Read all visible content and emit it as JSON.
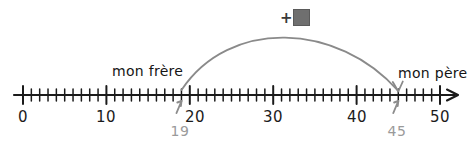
{
  "figure": {
    "type": "number-line-diagram",
    "language": "fr",
    "colors": {
      "line": "#1b1b1b",
      "axis_label": "#1b1b1b",
      "annotation_gray": "#9a9a9a",
      "arc": "#8a8a8a",
      "answer_box_fill": "#6f6f6f",
      "background": "#ffffff"
    }
  },
  "number_line": {
    "min": 0,
    "max": 50,
    "minor_tick_step": 1,
    "major_tick_step": 10,
    "has_end_arrow": true,
    "major_labels": [
      {
        "value": 0,
        "text": "0"
      },
      {
        "value": 10,
        "text": "10"
      },
      {
        "value": 20,
        "text": "20"
      },
      {
        "value": 30,
        "text": "30"
      },
      {
        "value": 40,
        "text": "40"
      },
      {
        "value": 50,
        "text": "50"
      }
    ]
  },
  "markers": [
    {
      "id": "mon-frere",
      "label": "mon frère",
      "value": 19,
      "value_text": "19",
      "arrow": "up"
    },
    {
      "id": "mon-pere",
      "label": "mon père",
      "value": 45,
      "value_text": "45",
      "arrow": "up"
    }
  ],
  "jump_arc": {
    "from": 19,
    "to": 45,
    "direction": "right",
    "operator": "+",
    "operand_text": "",
    "operand_hidden": true
  },
  "chart_data": {
    "type": "number-line",
    "title": "",
    "xlabel": "",
    "ylabel": "",
    "xlim": [
      0,
      50
    ],
    "tick_labels": [
      "0",
      "10",
      "20",
      "30",
      "40",
      "50"
    ],
    "minor_ticks": 1,
    "annotations": [
      {
        "label": "mon frère",
        "x": 19
      },
      {
        "label": "mon père",
        "x": 45
      },
      {
        "label": "+ ?",
        "x": 32,
        "note": "jump from 19 to 45"
      }
    ]
  }
}
